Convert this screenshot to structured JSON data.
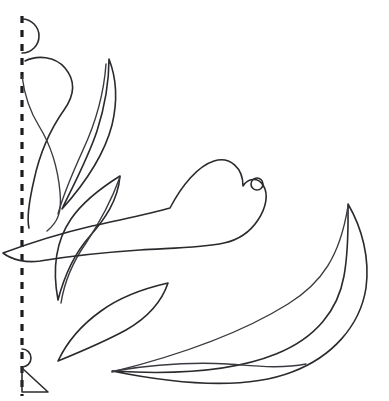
{
  "document": {
    "title": "Floral Applique Pattern Sheet",
    "background_color": "#ffffff",
    "ink_color": "#2b2b2f",
    "width": 389,
    "height": 401
  },
  "canvas": {
    "name": "pattern-canvas",
    "description": "Black-and-white line-art applique / quilting template with a heart-shaped flower, leaves and a large crescent leaf, plus a dashed fold line along the left edge."
  },
  "guides": {
    "fold_line": {
      "name": "fold-line",
      "label": "fold line",
      "orientation": "vertical",
      "x": 22,
      "y_start": 16,
      "y_end": 396,
      "dash_pattern": "7 7",
      "stroke_width": 3.2,
      "color": "#1c1c20"
    },
    "top_arc": {
      "name": "top-registration-arc",
      "label": "registration arc top",
      "cx": 22,
      "cy": 36,
      "radius": 17
    },
    "bottom_arc": {
      "name": "bottom-registration-arc",
      "label": "registration arc bottom",
      "cx": 22,
      "cy": 358,
      "radius": 9
    },
    "corner_triangle": {
      "name": "corner-triangle",
      "label": "corner alignment triangle",
      "points": "22,368 22,392 48,392"
    }
  },
  "shapes": [
    {
      "id": "hook-stem",
      "name": "hook-stem-shape",
      "label": "large hook stem",
      "path": "M25,61 C37,55 55,56 65,68 C76,81 74,96 64,110 C52,127 40,152 34,180 C28,206 27,220 29,228",
      "style": "stroke"
    },
    {
      "id": "hook-stem-inner",
      "name": "hook-stem-inner-shape",
      "label": "large hook stem inner edge",
      "path": "M22,76 C24,92 29,110 39,126 C52,147 58,170 60,192 C62,212 58,222 47,231",
      "style": "stroke-thin"
    },
    {
      "id": "narrow-blade",
      "name": "narrow-blade-leaf",
      "label": "tall narrow blade leaf",
      "path": "M109,59 C116,77 118,100 112,125 C105,152 88,180 62,209 C74,184 88,158 97,131 C105,106 109,81 109,59 Z",
      "style": "stroke"
    },
    {
      "id": "blade-vein",
      "name": "narrow-blade-vein",
      "label": "blade inner line",
      "path": "M106,64 C104,92 96,122 83,150 C73,172 64,192 58,214",
      "style": "stroke-thin"
    },
    {
      "id": "upper-leaf",
      "name": "upper-left-leaf",
      "label": "upper left pointed leaf",
      "path": "M120,176 C104,186 84,200 71,219 C56,241 52,268 58,300 C64,277 74,254 90,236 C104,220 118,201 120,176 Z",
      "style": "stroke"
    },
    {
      "id": "upper-leaf-inner",
      "name": "upper-left-leaf-inner-edge",
      "label": "upper leaf inner edge",
      "path": "M120,177 C112,199 100,222 86,243 C72,263 64,284 61,303",
      "style": "stroke-thin"
    },
    {
      "id": "lower-leaf",
      "name": "lower-left-leaf",
      "label": "lower left pointed leaf",
      "path": "M168,283 C146,288 120,297 101,311 C80,326 66,344 58,361 C80,352 104,342 126,330 C147,318 162,301 168,283 Z",
      "style": "stroke"
    },
    {
      "id": "heart-flower",
      "name": "heart-flower",
      "label": "central heart-shaped blossom",
      "path": "M3,253 C30,243 62,233 92,226 C123,219 150,214 170,208 C182,185 198,166 214,161 C230,156 243,168 243,186 C248,178 258,177 263,185 C269,194 266,208 258,220 C250,232 238,240 224,243 C200,248 170,248 140,250 C110,252 70,256 40,261 C26,263 12,260 3,253 Z",
      "style": "stroke"
    },
    {
      "id": "blossom-dot",
      "name": "blossom-circle-detail",
      "label": "small circle accent",
      "cx": 257,
      "cy": 184,
      "r": 6,
      "style": "stroke"
    },
    {
      "id": "crescent",
      "name": "large-crescent-leaf",
      "label": "large sweeping crescent leaf",
      "path": "M348,204 C362,228 370,258 366,288 C360,326 332,357 292,372 C248,389 186,386 112,371 C176,375 234,371 276,354 C316,338 338,310 344,276 C349,248 348,222 348,204 Z",
      "style": "stroke"
    },
    {
      "id": "stem-upper",
      "name": "long-stem-upper",
      "label": "long sweeping upper stem",
      "path": "M112,372 C176,356 240,334 288,304 C322,283 340,256 348,206",
      "style": "stroke-thin"
    },
    {
      "id": "stem-lower",
      "name": "long-stem-lower",
      "label": "long sweeping lower stem",
      "path": "M114,371 C150,365 192,362 228,364 C256,366 280,369 306,364",
      "style": "stroke-thin"
    }
  ]
}
